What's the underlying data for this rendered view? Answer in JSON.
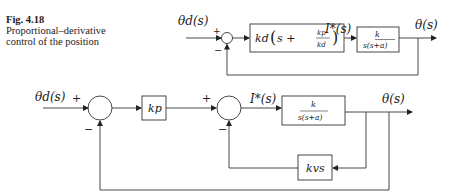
{
  "caption": {
    "figure_label": "Fig. 4.18",
    "line1": "Proportional–derivative",
    "line2": "control of the position"
  },
  "top_diagram": {
    "input_label": "θd(s)",
    "plus_sign": "+",
    "minus_sign": "−",
    "controller_block": "kd (s + kp/kd)",
    "controller_kd": "kd",
    "controller_s": "s +",
    "controller_num": "kp",
    "controller_den": "kd",
    "signal_label": "I*(s)",
    "plant_num": "k",
    "plant_den": "s(s+a)",
    "output_label": "θ(s)"
  },
  "bottom_diagram": {
    "input_label": "θd(s)",
    "plus_sign_1": "+",
    "minus_sign_1": "−",
    "gain_block": "kp",
    "plus_sign_2": "+",
    "minus_sign_2": "−",
    "signal_label": "I*(s)",
    "plant_num": "k",
    "plant_den": "s(s+a)",
    "output_label": "θ(s)",
    "feedback_block": "kvs"
  },
  "colors": {
    "line": "#333333",
    "text": "#222222"
  }
}
